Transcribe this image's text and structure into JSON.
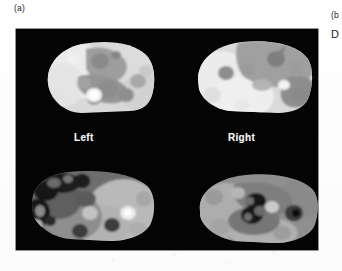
{
  "figure": {
    "panel_label_a": "(a)",
    "panel_label_b": "(b",
    "panel_label_d": "D",
    "background_color": "#040404",
    "page_color": "#ffffff",
    "label_color": "#f2f2f2",
    "side_labels": {
      "left": "Left",
      "right": "Right"
    },
    "slices": [
      {
        "id": "top-left",
        "name": "slice-top-left",
        "position": "upper-left",
        "side": "Left",
        "row": "upper",
        "modality": "grayscale-tomographic-cross-section",
        "description": "Bright rounded cross-section with darker mottled central region and small bright focal spot"
      },
      {
        "id": "top-right",
        "name": "slice-top-right",
        "position": "upper-right",
        "side": "Right",
        "row": "upper",
        "modality": "grayscale-tomographic-cross-section",
        "description": "Bright rounded cross-section with large darker upper band and several round dark foci"
      },
      {
        "id": "bottom-left",
        "name": "slice-bottom-left",
        "position": "lower-left",
        "side": "Left",
        "row": "lower",
        "modality": "grayscale-tomographic-cross-section",
        "description": "Mid-gray cross-section with dark clustered cavities on the left and a bright focal spot on the right"
      },
      {
        "id": "bottom-right",
        "name": "slice-bottom-right",
        "position": "lower-right",
        "side": "Right",
        "row": "lower",
        "modality": "grayscale-tomographic-cross-section",
        "description": "Mid-gray cross-section with dark clustered cavities near center and a dark round focus on the right"
      }
    ]
  }
}
